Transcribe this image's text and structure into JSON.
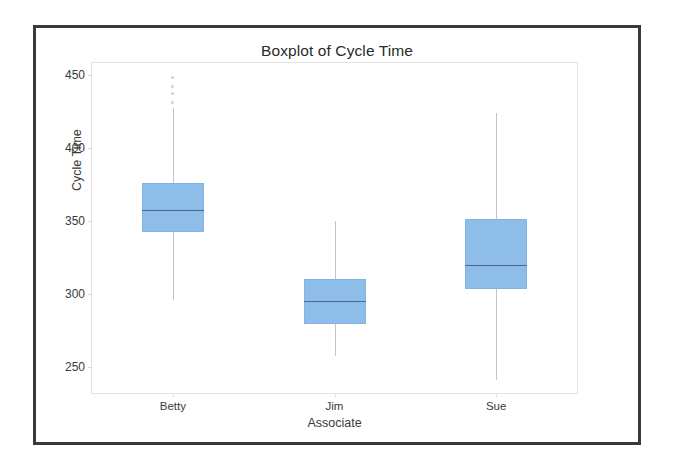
{
  "chart_data": {
    "type": "box",
    "title": "Boxplot of Cycle Time",
    "xlabel": "Associate",
    "ylabel": "Cycle Time",
    "categories": [
      "Betty",
      "Jim",
      "Sue"
    ],
    "ylim": [
      232,
      458
    ],
    "yticks": [
      250,
      300,
      350,
      400,
      450
    ],
    "ytick_labels": [
      "250",
      "300",
      "350",
      "400",
      "450"
    ],
    "grid": false,
    "legend": null,
    "box_color": "#8dbde8",
    "median_color": "#4a6a86",
    "whisker_color": "#c3c3c5",
    "series": [
      {
        "name": "Betty",
        "whisker_low": 296,
        "q1": 342,
        "median": 357,
        "q3": 376,
        "whisker_high": 427,
        "outliers": [
          431,
          437,
          442,
          448
        ]
      },
      {
        "name": "Jim",
        "whisker_low": 257,
        "q1": 279,
        "median": 295,
        "q3": 310,
        "whisker_high": 350,
        "outliers": []
      },
      {
        "name": "Sue",
        "whisker_low": 241,
        "q1": 303,
        "median": 320,
        "q3": 351,
        "whisker_high": 424,
        "outliers": []
      }
    ]
  },
  "chart": {
    "title": "Boxplot of Cycle Time",
    "y_axis_title": "Cycle Time",
    "x_axis_title": "Associate"
  }
}
